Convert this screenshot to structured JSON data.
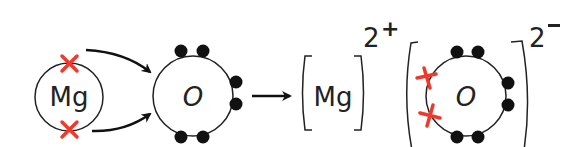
{
  "diagram": {
    "atoms": {
      "mg_atom": {
        "symbol": "Mg",
        "outer_electrons": 2,
        "electron_marker": "cross",
        "electron_color": "#ee3a2b"
      },
      "o_atom": {
        "symbol": "O",
        "outer_electrons": 6,
        "electron_marker": "dot",
        "electron_color": "#111111"
      }
    },
    "ions": {
      "mg_ion": {
        "symbol": "Mg",
        "charge_number": "2",
        "charge_sign": "+"
      },
      "o_ion": {
        "symbol": "O",
        "charge_number": "2",
        "charge_sign": "−",
        "outer_electrons_dots": 6,
        "outer_electrons_crosses": 2
      }
    },
    "arrows": [
      {
        "from": "mg_top_electron",
        "to": "o_atom"
      },
      {
        "from": "mg_bottom_electron",
        "to": "o_atom"
      },
      {
        "from": "reactants",
        "to": "products"
      }
    ],
    "colors": {
      "line": "#222222",
      "cross": "#ee3a2b",
      "dot": "#111111"
    }
  }
}
